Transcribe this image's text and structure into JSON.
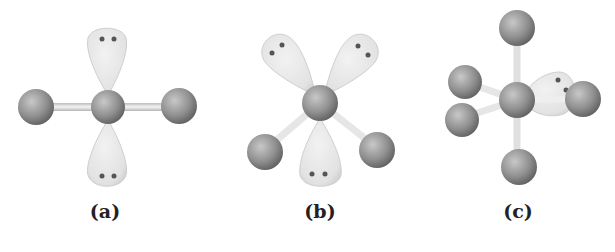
{
  "figure": {
    "panels": [
      {
        "label": "(a)",
        "description": "square planar geometry with two axial lone pairs and two bonded atoms"
      },
      {
        "label": "(b)",
        "description": "geometry with three lone pairs and two bonded atoms"
      },
      {
        "label": "(c)",
        "description": "seesaw-like geometry with one lone pair and four bonded atoms"
      }
    ],
    "colors": {
      "atom": "#8c8c8c",
      "lobe": "#e6e6e6",
      "bond": "#d9d9d9",
      "electron_dot": "#555555"
    }
  }
}
